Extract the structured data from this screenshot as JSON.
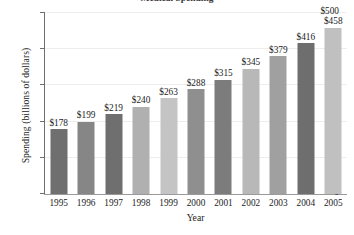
{
  "chart_data": {
    "type": "bar",
    "title": "Medical Spending",
    "title_clipped": true,
    "xlabel": "Year",
    "ylabel": "Spending (billions of dollars)",
    "categories": [
      "1995",
      "1996",
      "1997",
      "1998",
      "1999",
      "2000",
      "2001",
      "2002",
      "2003",
      "2004",
      "2005"
    ],
    "values": [
      178,
      199,
      219,
      240,
      263,
      288,
      315,
      345,
      379,
      416,
      458
    ],
    "value_labels": [
      "$178",
      "$199",
      "$219",
      "$240",
      "$263",
      "$288",
      "$315",
      "$345",
      "$379",
      "$416",
      "$458"
    ],
    "bar_colors": [
      "#6f6f6f",
      "#868686",
      "#6f6f6f",
      "#b0b0b0",
      "#c4c4c4",
      "#8f8f8f",
      "#7c7c7c",
      "#b8b8b8",
      "#a0a0a0",
      "#6e6e6e",
      "#c0c0c0"
    ],
    "ylim": [
      0,
      500
    ],
    "yticks": [
      0,
      100,
      200,
      300,
      400,
      500
    ],
    "ytick_labels": [
      "0",
      "100",
      "200",
      "300",
      "400",
      "$500"
    ],
    "grid": true,
    "grid_axis": "y",
    "legend": "none",
    "axis_color": "#6f6f6f",
    "gridline_color": "#ededed",
    "text_color": "#1b1b1b"
  }
}
